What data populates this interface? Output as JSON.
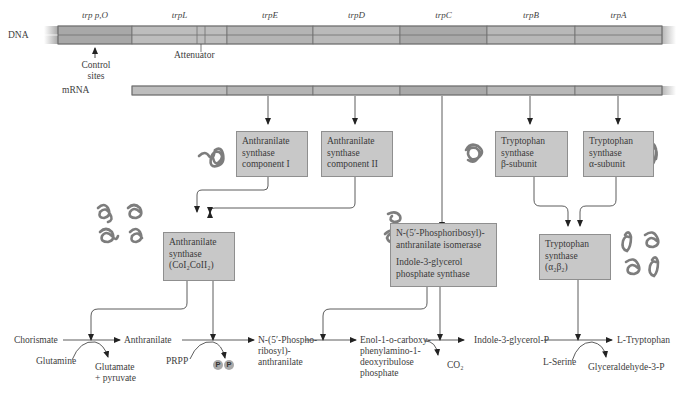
{
  "dna": {
    "label": "DNA",
    "genes": [
      {
        "name": "trp p,O",
        "x": 58,
        "w": 74,
        "color": "#a8a8a8"
      },
      {
        "name": "trpL",
        "x": 132,
        "w": 95,
        "color": "#bdbdbd"
      },
      {
        "name": "trpE",
        "x": 227,
        "w": 86,
        "color": "#b4b4b4"
      },
      {
        "name": "trpD",
        "x": 313,
        "w": 87,
        "color": "#bababa"
      },
      {
        "name": "trpC",
        "x": 400,
        "w": 87,
        "color": "#a9a9a9"
      },
      {
        "name": "trpB",
        "x": 487,
        "w": 88,
        "color": "#b8b8b8"
      },
      {
        "name": "trpA",
        "x": 575,
        "w": 87,
        "color": "#b6b6b6"
      }
    ],
    "control_sites_label": [
      "Control",
      "sites"
    ],
    "attenuator_label": "Attenuator"
  },
  "mrna": {
    "label": "mRNA"
  },
  "enzymes": {
    "as_comp1": [
      "Anthranilate",
      "synthase",
      "component I"
    ],
    "as_comp2": [
      "Anthranilate",
      "synthase",
      "component II"
    ],
    "ts_beta": [
      "Tryptophan",
      "synthase",
      "β-subunit"
    ],
    "ts_alpha": [
      "Tryptophan",
      "synthase",
      "α-subunit"
    ],
    "as_complex": [
      "Anthranilate",
      "synthase",
      "(CoI₂CoII₂)"
    ],
    "prai_igps": [
      "N-(5′-Phosphoribosyl)-",
      "anthranilate isomerase",
      "",
      "Indole-3-glycerol",
      "phosphate synthase"
    ],
    "ts_complex": [
      "Tryptophan",
      "synthase",
      "(α₂β₂)"
    ]
  },
  "pathway": {
    "chorismate": "Chorismate",
    "glutamine": "Glutamine",
    "glutamate": [
      "Glutamate",
      "+ pyruvate"
    ],
    "anthranilate": "Anthranilate",
    "prpp": "PRPP",
    "pp": [
      "P",
      "P"
    ],
    "npra": [
      "N-(5′-Phospho-",
      "ribosyl)-",
      "anthranilate"
    ],
    "cdrp": [
      "Enol-1-o-carboxy-",
      "phenylamino-1-",
      "deoxyribulose",
      "phosphate"
    ],
    "co2": "CO₂",
    "igp": "Indole-3-glycerol-P",
    "serine": "L-Serine",
    "tryptophan": "L-Tryptophan",
    "g3p": "Glyceraldehyde-3-P"
  },
  "colors": {
    "bar_border": "#6e6e6e",
    "box_fill": "#c8c8c8",
    "arrow": "#2a2a2a",
    "protein": "#8a8a8a"
  }
}
